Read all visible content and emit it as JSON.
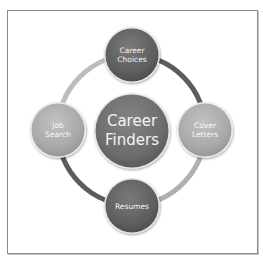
{
  "diagram": {
    "type": "cycle",
    "center": {
      "label": "Career\nFinders",
      "fill": "#6e6e6e"
    },
    "nodes": [
      {
        "id": "top",
        "label": "Career\nChoices",
        "fill": "#5e5e5e"
      },
      {
        "id": "right",
        "label": "Cover\nLetters",
        "fill": "#a9a9a9"
      },
      {
        "id": "bottom",
        "label": "Resumes",
        "fill": "#5a5a5a"
      },
      {
        "id": "left",
        "label": "Job\nSearch",
        "fill": "#a5a5a5"
      }
    ],
    "ring": {
      "segments": [
        {
          "from": "top",
          "to": "right",
          "color": "#5c5c5c"
        },
        {
          "from": "right",
          "to": "bottom",
          "color": "#b0b0b0"
        },
        {
          "from": "bottom",
          "to": "left",
          "color": "#5c5c5c"
        },
        {
          "from": "left",
          "to": "top",
          "color": "#b8b8b8"
        }
      ]
    },
    "frame_border_color": "#8a8a8a"
  }
}
